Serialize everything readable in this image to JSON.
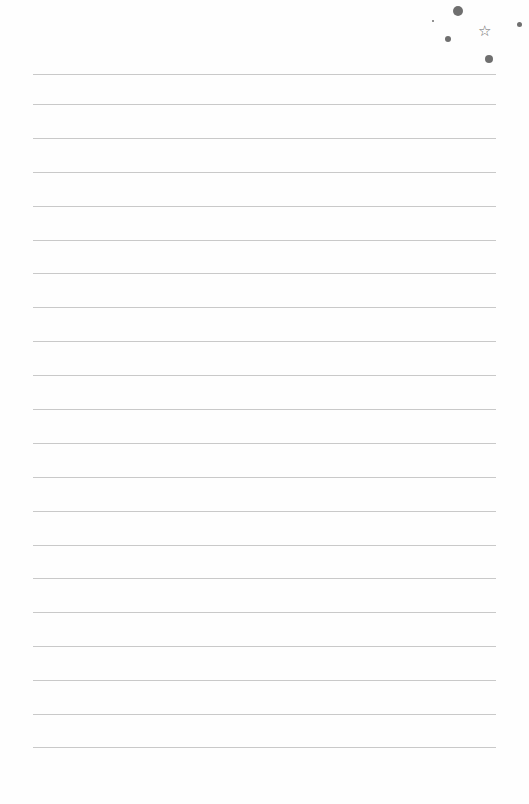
{
  "page": {
    "type": "lined-notepaper",
    "line_color": "#c9c9c9",
    "background": "#fefefe",
    "lines_y": [
      74,
      104,
      138,
      172,
      206,
      240,
      273,
      307,
      341,
      375,
      409,
      443,
      477,
      511,
      545,
      578,
      612,
      646,
      680,
      714,
      747
    ]
  },
  "decorations": {
    "star_glyph": "☆",
    "dots": [
      {
        "x": 458,
        "y": 11,
        "r": 5
      },
      {
        "x": 433,
        "y": 21,
        "r": 1
      },
      {
        "x": 448,
        "y": 39,
        "r": 3
      },
      {
        "x": 519,
        "y": 24,
        "r": 2.5
      },
      {
        "x": 489,
        "y": 59,
        "r": 4
      }
    ],
    "star": {
      "x": 485,
      "y": 32
    },
    "color": "#6f6f6f"
  }
}
